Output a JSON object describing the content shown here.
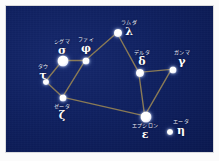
{
  "figure": {
    "caption": "",
    "colors": {
      "sky": "#102161",
      "sky_edge": "#0b1950",
      "line": "#8a7a55",
      "star": "#ffffff",
      "label_text": "#f4f6ff",
      "frame": "#d9dadd",
      "page": "#fbfbfb"
    }
  },
  "chart_data": {
    "type": "scatter",
    "xlabel": "",
    "ylabel": "",
    "xlim": [
      0,
      209
    ],
    "ylim": [
      0,
      148
    ],
    "grid": false,
    "legend": "none",
    "stars": [
      {
        "id": "tau",
        "kana": "タウ",
        "greek": "τ",
        "x": 40,
        "y": 76,
        "size": 6,
        "magnitude": "medium",
        "label_x": 37,
        "label_y": 58
      },
      {
        "id": "sigma",
        "kana": "シグマ",
        "greek": "σ",
        "x": 57,
        "y": 55,
        "size": 11,
        "magnitude": "bright",
        "label_x": 56,
        "label_y": 33
      },
      {
        "id": "phi",
        "kana": "ファイ",
        "greek": "φ",
        "x": 80,
        "y": 55,
        "size": 7,
        "magnitude": "medium",
        "label_x": 80,
        "label_y": 31
      },
      {
        "id": "zeta",
        "kana": "ゼータ",
        "greek": "ζ",
        "x": 57,
        "y": 92,
        "size": 7,
        "magnitude": "medium",
        "label_x": 56,
        "label_y": 98
      },
      {
        "id": "lambda",
        "kana": "ラムダ",
        "greek": "λ",
        "x": 112,
        "y": 27,
        "size": 8,
        "magnitude": "medium",
        "label_x": 123,
        "label_y": 14
      },
      {
        "id": "delta",
        "kana": "デルタ",
        "greek": "δ",
        "x": 134,
        "y": 67,
        "size": 8,
        "magnitude": "medium",
        "label_x": 136,
        "label_y": 44
      },
      {
        "id": "gamma",
        "kana": "ガンマ",
        "greek": "γ",
        "x": 167,
        "y": 64,
        "size": 7,
        "magnitude": "medium",
        "label_x": 176,
        "label_y": 44
      },
      {
        "id": "epsilon",
        "kana": "エプシロン",
        "greek": "ε",
        "x": 140,
        "y": 111,
        "size": 11,
        "magnitude": "bright",
        "label_x": 139,
        "label_y": 117
      },
      {
        "id": "eta",
        "kana": "エータ",
        "greek": "η",
        "x": 164,
        "y": 126,
        "size": 6,
        "magnitude": "medium",
        "label_x": 175,
        "label_y": 113
      }
    ],
    "links": [
      {
        "from": "tau",
        "to": "sigma"
      },
      {
        "from": "tau",
        "to": "zeta"
      },
      {
        "from": "sigma",
        "to": "phi"
      },
      {
        "from": "phi",
        "to": "zeta"
      },
      {
        "from": "phi",
        "to": "lambda"
      },
      {
        "from": "lambda",
        "to": "delta"
      },
      {
        "from": "delta",
        "to": "gamma"
      },
      {
        "from": "delta",
        "to": "epsilon"
      },
      {
        "from": "gamma",
        "to": "epsilon"
      },
      {
        "from": "zeta",
        "to": "epsilon"
      }
    ]
  }
}
